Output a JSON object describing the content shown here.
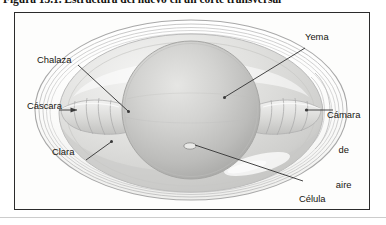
{
  "caption": {
    "text": "Figura 13.1. Estructura del huevo en un corte transversal"
  },
  "figure": {
    "title": "Estructura del huevo en un corte transversal",
    "palette": {
      "frame_border": "#2b2b2b",
      "background": "#fdfdfc",
      "shell_line": "#b9b9b9",
      "albumen_fill": "#dcdcda",
      "yolk_fill": "#c9c9c7",
      "leader_line": "#3a3a3a",
      "text": "#16150f"
    },
    "labels": [
      {
        "id": "chalaza",
        "text": "Chalaza",
        "side": "left",
        "lines": [
          "Chalaza"
        ]
      },
      {
        "id": "cascara",
        "text": "Cáscara",
        "side": "left",
        "lines": [
          "Cáscara"
        ]
      },
      {
        "id": "clara",
        "text": "Clara",
        "side": "left",
        "lines": [
          "Clara"
        ]
      },
      {
        "id": "yema",
        "text": "Yema",
        "side": "right",
        "lines": [
          "Yema"
        ]
      },
      {
        "id": "camara-de-aire",
        "text": "Cámara de aire",
        "side": "right",
        "lines": [
          "Cámara",
          "de",
          "aire"
        ]
      },
      {
        "id": "celula-germinal",
        "text": "Célula germinal",
        "side": "right",
        "lines": [
          "Célula",
          "germinal"
        ]
      }
    ],
    "parts": [
      {
        "id": "shell",
        "name": "Cáscara"
      },
      {
        "id": "air-chamber",
        "name": "Cámara de aire"
      },
      {
        "id": "albumen",
        "name": "Clara"
      },
      {
        "id": "chalaza-left",
        "name": "Chalaza"
      },
      {
        "id": "chalaza-right",
        "name": "Chalaza"
      },
      {
        "id": "yolk",
        "name": "Yema"
      },
      {
        "id": "germinal-disc",
        "name": "Célula germinal"
      }
    ]
  }
}
